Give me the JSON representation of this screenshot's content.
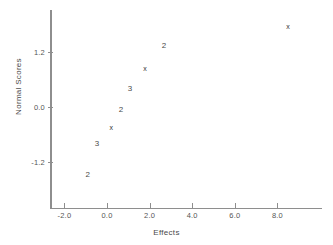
{
  "chart_data": {
    "type": "scatter",
    "title": "",
    "xlabel": "Effects",
    "ylabel": "Normal Scores",
    "xlim": [
      -2.7,
      9.5
    ],
    "ylim": [
      -1.9,
      2.1
    ],
    "grid": false,
    "legend": null,
    "xticks": [
      "-2.0",
      "0.0",
      "2.0",
      "4.0",
      "6.0",
      "8.0"
    ],
    "xtick_values": [
      -2.0,
      0.0,
      2.0,
      4.0,
      6.0,
      8.0
    ],
    "yticks": [
      "1.2",
      "0.0",
      "-1.2"
    ],
    "ytick_values": [
      1.2,
      0.0,
      -1.2
    ],
    "point_labels_meaning": "digit = number of overlapping points at that location; x = single point",
    "points": [
      {
        "x": -0.9,
        "y": -1.48,
        "label": "2",
        "marker": "digit"
      },
      {
        "x": -0.47,
        "y": -0.81,
        "label": "3",
        "marker": "digit"
      },
      {
        "x": 0.2,
        "y": -0.43,
        "label": "x",
        "marker": "x"
      },
      {
        "x": 0.66,
        "y": -0.07,
        "label": "2",
        "marker": "digit"
      },
      {
        "x": 1.08,
        "y": 0.39,
        "label": "3",
        "marker": "digit"
      },
      {
        "x": 1.78,
        "y": 0.86,
        "label": "x",
        "marker": "x"
      },
      {
        "x": 2.67,
        "y": 1.34,
        "label": "2",
        "marker": "digit"
      },
      {
        "x": 8.5,
        "y": 1.77,
        "label": "x",
        "marker": "x"
      }
    ]
  },
  "axes": {
    "x_title": "Effects",
    "y_title": "Normal Scores"
  },
  "colors": {
    "background": "#ffffff",
    "axis": "#8e8e8e",
    "text": "#4a4a4a",
    "marker": "#333333"
  }
}
